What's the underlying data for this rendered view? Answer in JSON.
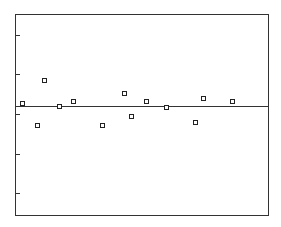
{
  "chart_data": {
    "type": "scatter",
    "title": "",
    "xlabel": "",
    "ylabel": "",
    "grid": false,
    "legend": null,
    "marker": "open-square",
    "reference_line": {
      "y": 0,
      "orientation": "horizontal"
    },
    "y_ticks": [
      2,
      1,
      0,
      -1,
      -2
    ],
    "y_tick_labels": [],
    "ylim": [
      -2.7,
      2.3
    ],
    "xlim": [
      0,
      253
    ],
    "points": [
      {
        "x": 7,
        "y": 0.08
      },
      {
        "x": 22,
        "y": -0.48
      },
      {
        "x": 29,
        "y": 0.65
      },
      {
        "x": 44,
        "y": 0.0
      },
      {
        "x": 58,
        "y": 0.13
      },
      {
        "x": 87,
        "y": -0.48
      },
      {
        "x": 109,
        "y": 0.33
      },
      {
        "x": 116,
        "y": -0.25
      },
      {
        "x": 131,
        "y": 0.13
      },
      {
        "x": 151,
        "y": -0.03
      },
      {
        "x": 180,
        "y": -0.4
      },
      {
        "x": 188,
        "y": 0.2
      },
      {
        "x": 217,
        "y": 0.13
      }
    ]
  },
  "layout": {
    "frame": {
      "left": 15,
      "top": 14,
      "right": 268,
      "bottom": 215
    },
    "zero_y_px": 106,
    "px_per_y_unit": 40,
    "tick_px": [
      35,
      74,
      114,
      154,
      193
    ],
    "colors": {
      "axis": "#333333",
      "marker": "#222222",
      "background": "#ffffff"
    }
  }
}
